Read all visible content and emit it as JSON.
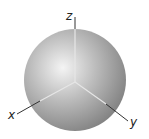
{
  "diagram": {
    "type": "sphere-with-3d-axes",
    "sphere": {
      "center": [
        75,
        80
      ],
      "radius": 51,
      "highlight_color": "#f2f2f2",
      "mid_color": "#b8b8b8",
      "edge_color": "#7a7a7a"
    },
    "origin": [
      75,
      82
    ],
    "axes": [
      {
        "name": "z",
        "label": "z",
        "end": [
          75,
          17
        ],
        "label_pos": [
          66,
          20
        ]
      },
      {
        "name": "x",
        "label": "x",
        "end": [
          17,
          114
        ],
        "label_pos": [
          9,
          118
        ]
      },
      {
        "name": "y",
        "label": "y",
        "end": [
          128,
          121
        ],
        "label_pos": [
          131,
          124
        ]
      }
    ],
    "axis_inner_color": "#e6e6e6",
    "axis_outer_color": "#333333"
  }
}
